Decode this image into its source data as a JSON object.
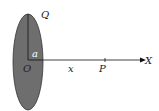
{
  "diagram": {
    "title": "",
    "labels": {
      "charge": "Q",
      "radius": "a",
      "origin": "O",
      "distance": "x",
      "point": "P",
      "axis": "X"
    },
    "colors": {
      "disc_fill": "#6e6e6e",
      "stroke": "#222222"
    }
  }
}
